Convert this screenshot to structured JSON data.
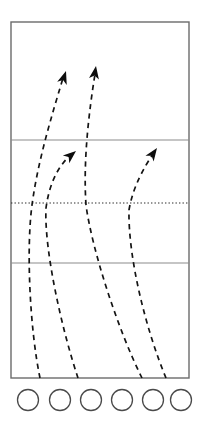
{
  "diagram": {
    "background_color": "#ffffff",
    "court": {
      "outline_color": "#6b6b6b",
      "fill_color": "#ffffff",
      "x": 11,
      "y": 22,
      "width": 178,
      "height": 356,
      "zones_label": "court-zones"
    },
    "court_lines": [
      {
        "name": "attack-line-upper",
        "style": "solid",
        "color": "#8c8c8c",
        "y": 140,
        "x1": 11,
        "x2": 189
      },
      {
        "name": "center-line-dotted",
        "style": "dotted",
        "color": "#2a2a2a",
        "y": 203,
        "x1": 11,
        "x2": 189
      },
      {
        "name": "attack-line-lower",
        "style": "solid",
        "color": "#8c8c8c",
        "y": 263,
        "x1": 11,
        "x2": 189
      }
    ],
    "players": [
      {
        "name": "player-position-1",
        "label": "",
        "cx": 28,
        "cy": 400,
        "r": 10.5
      },
      {
        "name": "player-position-2",
        "label": "",
        "cx": 60,
        "cy": 400,
        "r": 10.5
      },
      {
        "name": "player-position-3",
        "label": "",
        "cx": 91,
        "cy": 400,
        "r": 10.5
      },
      {
        "name": "player-position-4",
        "label": "",
        "cx": 122,
        "cy": 400,
        "r": 10.5
      },
      {
        "name": "player-position-5",
        "label": "",
        "cx": 153,
        "cy": 400,
        "r": 10.5
      },
      {
        "name": "player-position-6",
        "label": "",
        "cx": 181,
        "cy": 400,
        "r": 10.5
      }
    ],
    "paths": [
      {
        "name": "movement-path-1",
        "has_arrowhead": true,
        "d": "M 40 378 C 30 330 26 250 32 205 C 38 160 52 115 63 78",
        "arrow": {
          "x": 66,
          "y": 71,
          "angle": -72
        }
      },
      {
        "name": "movement-path-2",
        "has_arrowhead": true,
        "d": "M 78 378 C 62 330 44 250 46 208 C 50 178 62 162 72 154",
        "arrow": {
          "x": 76,
          "y": 151,
          "angle": -40
        }
      },
      {
        "name": "movement-path-3",
        "has_arrowhead": true,
        "d": "M 142 378 C 118 330 92 250 86 205 C 83 160 89 112 95 74",
        "arrow": {
          "x": 96,
          "y": 66,
          "angle": -81
        }
      },
      {
        "name": "movement-path-4",
        "has_arrowhead": true,
        "d": "M 166 378 C 146 330 128 258 129 210 C 133 186 145 166 153 154",
        "arrow": {
          "x": 157,
          "y": 148,
          "angle": -55
        }
      }
    ]
  }
}
